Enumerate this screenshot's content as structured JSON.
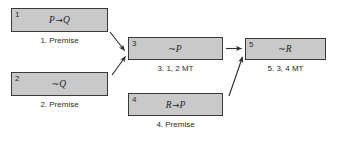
{
  "diagram": {
    "type": "logic-proof-flowchart",
    "background_color": "#ffffff",
    "node_fill_color": "#c9c9c9",
    "node_border_color": "#3a3a3a",
    "text_color": "#2b2b2b",
    "nodes": [
      {
        "id": "node-1",
        "number": "1",
        "expression_left": "P",
        "expression_op": "→",
        "expression_right": "Q",
        "expression_prefix": "",
        "caption": "1. Premise"
      },
      {
        "id": "node-2",
        "number": "2",
        "expression_left": "Q",
        "expression_op": "",
        "expression_right": "",
        "expression_prefix": "~",
        "caption": "2. Premise"
      },
      {
        "id": "node-3",
        "number": "3",
        "expression_left": "P",
        "expression_op": "",
        "expression_right": "",
        "expression_prefix": "~",
        "caption": "3. 1, 2 MT"
      },
      {
        "id": "node-4",
        "number": "4",
        "expression_left": "R",
        "expression_op": "→",
        "expression_right": "P",
        "expression_prefix": "",
        "caption": "4. Premise"
      },
      {
        "id": "node-5",
        "number": "5",
        "expression_left": "R",
        "expression_op": "",
        "expression_right": "",
        "expression_prefix": "~",
        "caption": "5. 3, 4 MT"
      }
    ],
    "edges": [
      {
        "id": "edge-1-3",
        "from": "node-1",
        "to": "node-3"
      },
      {
        "id": "edge-2-3",
        "from": "node-2",
        "to": "node-3"
      },
      {
        "id": "edge-3-5",
        "from": "node-3",
        "to": "node-5"
      },
      {
        "id": "edge-4-5",
        "from": "node-4",
        "to": "node-5"
      }
    ]
  }
}
